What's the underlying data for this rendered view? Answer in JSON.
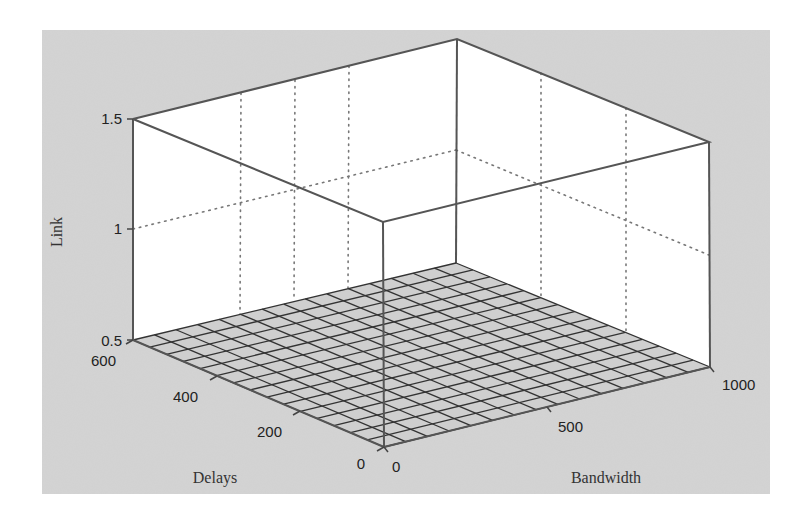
{
  "chart_data": {
    "type": "surface3d",
    "title": "",
    "xlabel": "Bandwidth",
    "ylabel": "Delays",
    "zlabel": "Link",
    "x_ticks": [
      "0",
      "500",
      "1000"
    ],
    "y_ticks": [
      "0",
      "200",
      "400",
      "600"
    ],
    "z_ticks": [
      "0.5",
      "1",
      "1.5"
    ],
    "xlim": [
      0,
      1000
    ],
    "ylim": [
      0,
      600
    ],
    "zlim": [
      0.5,
      1.5
    ],
    "grid": true,
    "mesh_divisions": 15,
    "surface": "constant plane at z = 0.5 over the full Bandwidth x Delays domain",
    "z_value": 0.5,
    "colors": {
      "figure_background": "#d4d4d4",
      "axes_background": "#ffffff",
      "mesh_face": "#cfcfcf",
      "mesh_edge": "#333333"
    }
  },
  "labels": {
    "z_axis": "Link",
    "y_axis": "Delays",
    "x_axis": "Bandwidth",
    "z_tick_0": "0.5",
    "z_tick_1": "1",
    "z_tick_2": "1.5",
    "y_tick_600": "600",
    "y_tick_400": "400",
    "y_tick_200": "200",
    "y_tick_0": "0",
    "x_tick_0": "0",
    "x_tick_500": "500",
    "x_tick_1000": "1000"
  }
}
